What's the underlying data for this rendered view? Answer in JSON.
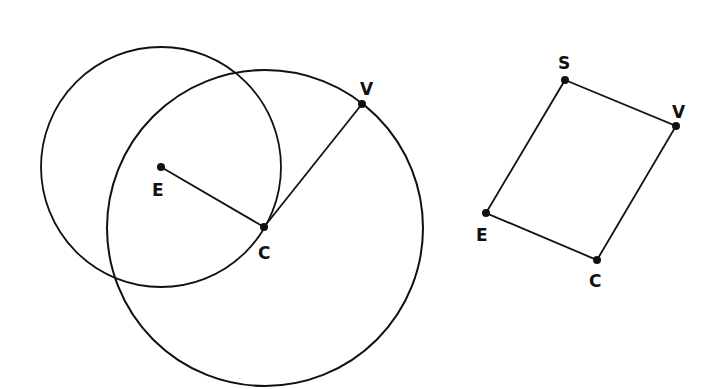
{
  "diagram": {
    "stroke_color": "#111111",
    "background": "#ffffff",
    "left_figure": {
      "circles": [
        {
          "name": "circle-centered-E",
          "cx": 161,
          "cy": 167,
          "r": 120
        },
        {
          "name": "circle-centered-C",
          "cx": 265,
          "cy": 228,
          "r": 158
        }
      ],
      "points": [
        {
          "label": "E",
          "x": 161,
          "y": 167,
          "lx": 152,
          "ly": 196
        },
        {
          "label": "C",
          "x": 264,
          "y": 227,
          "lx": 258,
          "ly": 259
        },
        {
          "label": "V",
          "x": 362,
          "y": 104,
          "lx": 360,
          "ly": 95
        }
      ],
      "segments": [
        {
          "from": "E",
          "to": "C"
        },
        {
          "from": "C",
          "to": "V"
        }
      ]
    },
    "right_figure": {
      "shape": "parallelogram",
      "points": [
        {
          "label": "S",
          "x": 565,
          "y": 80,
          "lx": 558,
          "ly": 69
        },
        {
          "label": "V",
          "x": 676,
          "y": 126,
          "lx": 672,
          "ly": 118
        },
        {
          "label": "C",
          "x": 597,
          "y": 260,
          "lx": 589,
          "ly": 287
        },
        {
          "label": "E",
          "x": 486,
          "y": 213,
          "lx": 476,
          "ly": 241
        }
      ],
      "segments": [
        {
          "from": "S",
          "to": "V"
        },
        {
          "from": "V",
          "to": "C"
        },
        {
          "from": "C",
          "to": "E"
        },
        {
          "from": "E",
          "to": "S"
        }
      ]
    }
  }
}
